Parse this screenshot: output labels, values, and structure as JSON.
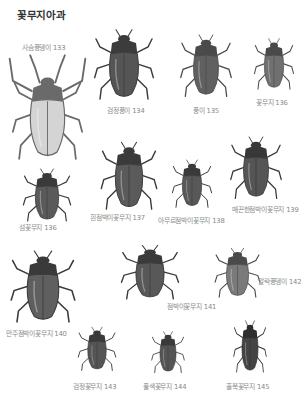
{
  "page": {
    "title": "꽃무지아과"
  },
  "specimens": [
    {
      "id": "133",
      "label": "사슴풍뎅이 133",
      "x": 5,
      "y": 52,
      "w": 85,
      "h": 112,
      "lx": 22,
      "ly": 42,
      "shade": "#6a6a6a",
      "shell": "#d4d4d4",
      "horns": true
    },
    {
      "id": "134",
      "label": "검정풍이 134",
      "x": 88,
      "y": 15,
      "w": 72,
      "h": 88,
      "lx": 107,
      "ly": 105,
      "shade": "#3c3c3c",
      "shell": "#555555",
      "horns": false
    },
    {
      "id": "135",
      "label": "풍이 135",
      "x": 175,
      "y": 22,
      "w": 62,
      "h": 78,
      "lx": 193,
      "ly": 105,
      "shade": "#4a4a4a",
      "shell": "#606060",
      "horns": false
    },
    {
      "id": "136a",
      "label": "꽃무지 136",
      "x": 250,
      "y": 28,
      "w": 48,
      "h": 64,
      "lx": 256,
      "ly": 97,
      "shade": "#4a4a4a",
      "shell": "#707070",
      "horns": false
    },
    {
      "id": "137",
      "label": "흰점박이꽃무지 137",
      "x": 95,
      "y": 128,
      "w": 68,
      "h": 85,
      "lx": 90,
      "ly": 212,
      "shade": "#3a3a3a",
      "shell": "#5a5a5a",
      "horns": false
    },
    {
      "id": "138",
      "label": "아무르점박이꽃무지 138",
      "x": 168,
      "y": 150,
      "w": 48,
      "h": 60,
      "lx": 158,
      "ly": 215,
      "shade": "#3a3a3a",
      "shell": "#585858",
      "horns": false
    },
    {
      "id": "139",
      "label": "매끈한점박이꽃무지 139",
      "x": 225,
      "y": 124,
      "w": 62,
      "h": 78,
      "lx": 232,
      "ly": 204,
      "shade": "#383838",
      "shell": "#555555",
      "horns": false
    },
    {
      "id": "136b",
      "label": "섬꽃무지 136",
      "x": 18,
      "y": 158,
      "w": 58,
      "h": 66,
      "lx": 19,
      "ly": 222,
      "shade": "#3a3a3a",
      "shell": "#5a5a5a",
      "horns": false
    },
    {
      "id": "140",
      "label": "만주점박이꽃무지 140",
      "x": 4,
      "y": 236,
      "w": 78,
      "h": 90,
      "lx": 6,
      "ly": 328,
      "shade": "#3a3a3a",
      "shell": "#5f5f5f",
      "horns": false
    },
    {
      "id": "141",
      "label": "점박이꽃무지 141",
      "x": 115,
      "y": 234,
      "w": 70,
      "h": 68,
      "lx": 167,
      "ly": 301,
      "shade": "#3a3a3a",
      "shell": "#585858",
      "horns": false
    },
    {
      "id": "142",
      "label": "알락풍뎅이 142",
      "x": 210,
      "y": 238,
      "w": 55,
      "h": 62,
      "lx": 258,
      "ly": 276,
      "shade": "#4a4a4a",
      "shell": "#7a7a7a",
      "horns": false
    },
    {
      "id": "143",
      "label": "검정꽃무지 143",
      "x": 74,
      "y": 318,
      "w": 46,
      "h": 55,
      "lx": 73,
      "ly": 381,
      "shade": "#3a3a3a",
      "shell": "#555555",
      "horns": false
    },
    {
      "id": "144",
      "label": "풀색꽃무지 144",
      "x": 148,
      "y": 323,
      "w": 40,
      "h": 52,
      "lx": 143,
      "ly": 381,
      "shade": "#3a3a3a",
      "shell": "#555555",
      "horns": false
    },
    {
      "id": "145",
      "label": "홀쭉꽃무지 145",
      "x": 230,
      "y": 310,
      "w": 40,
      "h": 65,
      "lx": 226,
      "ly": 381,
      "shade": "#2e2e2e",
      "shell": "#444444",
      "horns": false
    }
  ]
}
